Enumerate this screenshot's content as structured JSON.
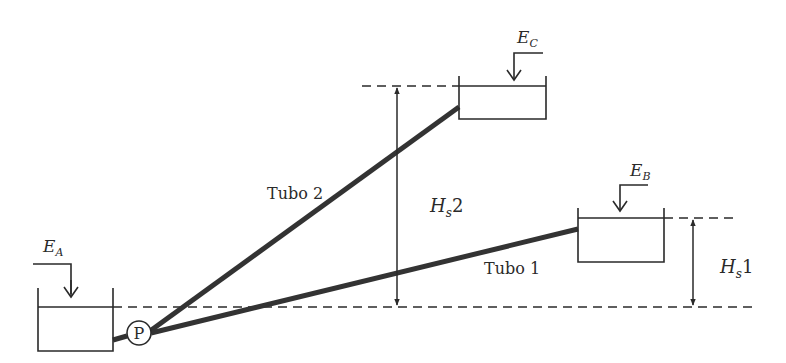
{
  "diagram": {
    "type": "pumping-system-schematic",
    "colors": {
      "background": "#ffffff",
      "line": "#2a2a2a",
      "pipe": "#333333"
    },
    "reservoirs": [
      {
        "id": "A",
        "label": "E",
        "subscript": "A"
      },
      {
        "id": "B",
        "label": "E",
        "subscript": "B"
      },
      {
        "id": "C",
        "label": "E",
        "subscript": "C"
      }
    ],
    "pump": {
      "label": "P"
    },
    "pipes": [
      {
        "id": "tubo1",
        "label": "Tubo 1",
        "from": "P",
        "to": "B"
      },
      {
        "id": "tubo2",
        "label": "Tubo 2",
        "from": "P",
        "to": "C"
      }
    ],
    "heights": [
      {
        "id": "hs1",
        "label": "H",
        "subscript": "s",
        "suffix": "1"
      },
      {
        "id": "hs2",
        "label": "H",
        "subscript": "s",
        "suffix": "2"
      }
    ]
  }
}
